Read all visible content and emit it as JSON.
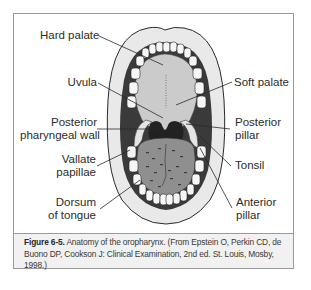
{
  "figure": {
    "number": "Figure 6-5.",
    "caption": " Anatomy of the oropharynx. (From Epstein O, Perkin CD, de Buono DP, Cookson J: Clinical Examination, 2nd ed. St. Louis, Mosby, 1998.)"
  },
  "labels": {
    "left": [
      {
        "id": "hard-palate",
        "lines": [
          "Hard palate"
        ]
      },
      {
        "id": "uvula",
        "lines": [
          "Uvula"
        ]
      },
      {
        "id": "posterior-pharyngeal-wall",
        "lines": [
          "Posterior",
          "pharyngeal wall"
        ]
      },
      {
        "id": "vallate-papillae",
        "lines": [
          "Vallate",
          "papillae"
        ]
      },
      {
        "id": "dorsum-of-tongue",
        "lines": [
          "Dorsum",
          "of tongue"
        ]
      }
    ],
    "right": [
      {
        "id": "soft-palate",
        "lines": [
          "Soft palate"
        ]
      },
      {
        "id": "posterior-pillar",
        "lines": [
          "Posterior",
          "pillar"
        ]
      },
      {
        "id": "tonsil",
        "lines": [
          "Tonsil"
        ]
      },
      {
        "id": "anterior-pillar",
        "lines": [
          "Anterior",
          "pillar"
        ]
      }
    ]
  },
  "colors": {
    "lip": "#e6e6e6",
    "cavity_dark": "#3c3c3c",
    "palate": "#c9c9c9",
    "tongue": "#8e8e8e",
    "teeth": "#f4f4f4",
    "outline": "#2a2a2a",
    "frame_border": "#9a9a9a",
    "caption_bg": "#f1f1f1"
  }
}
